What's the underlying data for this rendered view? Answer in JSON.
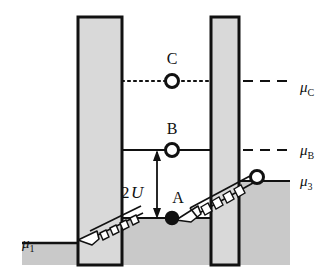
{
  "figure": {
    "background_color": "#ffffff",
    "ink_color": "#111111",
    "barrier_fill": "#d9d9d9",
    "sea_fill": "#c9c9c9",
    "rung_fill": "#ffffff"
  },
  "chemical_potentials": [
    {
      "key": "mu1",
      "base": "μ",
      "sub": "1",
      "label": "μ₁",
      "style": "solid-edge",
      "x": 30,
      "y": 243
    },
    {
      "key": "mu3",
      "base": "μ",
      "sub": "3",
      "label": "μ₃",
      "style": "solid-edge",
      "x": 306,
      "y": 181
    },
    {
      "key": "muB",
      "base": "μ",
      "sub": "B",
      "label": "μʙ",
      "style": "dashed",
      "x": 306,
      "y": 150
    },
    {
      "key": "muC",
      "base": "μ",
      "sub": "C",
      "label": "μᴄ",
      "style": "dotted-dashed",
      "x": 306,
      "y": 88
    }
  ],
  "states": [
    {
      "key": "A",
      "label": "A",
      "marker": "filled-circle",
      "level": "well-bottom",
      "cx": 172,
      "cy": 218,
      "label_x": 176,
      "label_y": 202
    },
    {
      "key": "B",
      "label": "B",
      "marker": "open-circle",
      "level": "muB",
      "cx": 172,
      "cy": 150,
      "label_x": 172,
      "label_y": 133
    },
    {
      "key": "C",
      "label": "C",
      "marker": "open-circle",
      "level": "muC",
      "cx": 172,
      "cy": 81,
      "label_x": 172,
      "label_y": 63
    },
    {
      "key": "R",
      "label": "",
      "marker": "open-circle",
      "level": "mu3",
      "cx": 257,
      "cy": 177,
      "label_x": 0,
      "label_y": 0
    }
  ],
  "annotations": [
    {
      "key": "coupling",
      "text_prefix": "2",
      "text_italic": "U",
      "text": "2U",
      "x": 138,
      "y": 192,
      "arrow_top_y": 150,
      "arrow_bottom_y": 218,
      "arrow_x": 157,
      "meaning": "energy separation between level A and level B"
    }
  ],
  "geometry": {
    "barrier_left": {
      "x": 78,
      "y": 17,
      "w": 44,
      "h": 248
    },
    "barrier_right": {
      "x": 211,
      "y": 17,
      "w": 28,
      "h": 248
    },
    "sea_left": {
      "label": "left lead electron sea",
      "top_y": 243
    },
    "sea_well": {
      "label": "central well electron sea",
      "top_y": 218
    },
    "sea_right": {
      "label": "right lead electron sea",
      "top_y": 181
    },
    "level_muB_y": 150,
    "level_muC_y": 81,
    "tunnel_ramp_left": {
      "x1": 92,
      "y1": 236,
      "x2": 140,
      "y2": 212,
      "rungs": 6
    },
    "tunnel_ramp_right": {
      "x1": 189,
      "y1": 212,
      "x2": 252,
      "y2": 177,
      "rungs": 7
    }
  },
  "line_styles": {
    "muB": "dashed",
    "muC": "dotted",
    "muC_right": "dashed",
    "mu3": "solid",
    "mu1": "solid"
  }
}
